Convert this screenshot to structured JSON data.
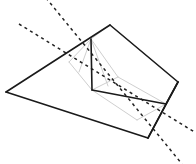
{
  "canvas": {
    "width": 196,
    "height": 164,
    "background": "#ffffff",
    "title": "3D polyhedron wireframe with dashed construction lines"
  },
  "styles": {
    "solid_color": "#1a1a1a",
    "solid_width": 1.6,
    "hidden_color": "#c8c8c8",
    "hidden_width": 0.9,
    "dashed_color": "#222222",
    "dashed_width": 1.5,
    "dash_pattern": "3,3.5"
  },
  "points": {
    "base_left": {
      "x": 6,
      "y": 92
    },
    "base_bottom": {
      "x": 148,
      "y": 138
    },
    "base_right": {
      "x": 178,
      "y": 82
    },
    "base_top": {
      "x": 110,
      "y": 25
    },
    "ridge_top": {
      "x": 91,
      "y": 39
    },
    "inner_left": {
      "x": 92,
      "y": 90
    },
    "inner_right": {
      "x": 166,
      "y": 104
    },
    "hidden_a": {
      "x": 69,
      "y": 62
    },
    "hidden_b": {
      "x": 118,
      "y": 77
    },
    "hidden_c": {
      "x": 137,
      "y": 120
    }
  },
  "solid_edges": [
    {
      "name": "outer-edge-left-top",
      "x1": 6,
      "y1": 92,
      "x2": 110,
      "y2": 25
    },
    {
      "name": "outer-edge-top-right",
      "x1": 110,
      "y1": 25,
      "x2": 178,
      "y2": 82
    },
    {
      "name": "outer-edge-right-bottom",
      "x1": 178,
      "y1": 82,
      "x2": 148,
      "y2": 138
    },
    {
      "name": "outer-edge-bottom-left",
      "x1": 148,
      "y1": 138,
      "x2": 6,
      "y2": 92
    },
    {
      "name": "ridge-vertical",
      "x1": 91,
      "y1": 39,
      "x2": 92,
      "y2": 90
    },
    {
      "name": "inner-edge-horizontal",
      "x1": 92,
      "y1": 90,
      "x2": 166,
      "y2": 104
    },
    {
      "name": "inner-edge-right-down",
      "x1": 166,
      "y1": 104,
      "x2": 148,
      "y2": 138
    },
    {
      "name": "inner-edge-right-up",
      "x1": 166,
      "y1": 104,
      "x2": 178,
      "y2": 82
    }
  ],
  "hidden_edges": [
    {
      "name": "hidden-ridge-to-left",
      "x1": 91,
      "y1": 39,
      "x2": 69,
      "y2": 62
    },
    {
      "name": "hidden-ridge-to-midleft",
      "x1": 91,
      "y1": 39,
      "x2": 79,
      "y2": 72
    },
    {
      "name": "hidden-ridge-to-inner-b",
      "x1": 91,
      "y1": 39,
      "x2": 118,
      "y2": 77
    },
    {
      "name": "hidden-ridge-to-innerL",
      "x1": 91,
      "y1": 39,
      "x2": 108,
      "y2": 86
    },
    {
      "name": "hidden-left-to-innerL",
      "x1": 69,
      "y1": 62,
      "x2": 92,
      "y2": 90
    },
    {
      "name": "hidden-b-to-innerR",
      "x1": 118,
      "y1": 77,
      "x2": 166,
      "y2": 104
    },
    {
      "name": "hidden-b-to-innerL",
      "x1": 118,
      "y1": 77,
      "x2": 92,
      "y2": 90
    },
    {
      "name": "hidden-innerL-to-c",
      "x1": 92,
      "y1": 90,
      "x2": 137,
      "y2": 120
    },
    {
      "name": "hidden-c-to-innerR",
      "x1": 137,
      "y1": 120,
      "x2": 166,
      "y2": 104
    },
    {
      "name": "hidden-ridge-to-top",
      "x1": 91,
      "y1": 39,
      "x2": 110,
      "y2": 25
    }
  ],
  "dashed_lines": [
    {
      "name": "dashed-line-upper",
      "x1": 19,
      "y1": 24,
      "x2": 196,
      "y2": 133
    },
    {
      "name": "dashed-line-lower",
      "x1": 46,
      "y1": -2,
      "x2": 182,
      "y2": 164
    }
  ]
}
